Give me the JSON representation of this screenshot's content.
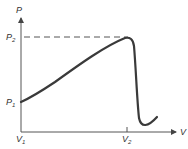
{
  "diagram": {
    "type": "pressure-volume curve",
    "axes": {
      "y_label": "P",
      "x_label": "V"
    },
    "y_ticks": [
      {
        "main": "P",
        "sub": "2"
      },
      {
        "main": "P",
        "sub": "1"
      }
    ],
    "x_ticks": [
      {
        "main": "V",
        "sub": "1"
      },
      {
        "main": "V",
        "sub": "2"
      }
    ],
    "colors": {
      "curve": "#3a3a3a",
      "axes": "#555555",
      "dashed": "#555555"
    }
  }
}
